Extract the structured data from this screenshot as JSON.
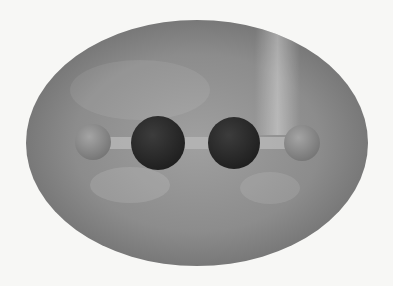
{
  "figure": {
    "title": "Acetylene molecule (H–C≡C–H) enclosed in electron density isosurface",
    "background": "#f7f7f5",
    "envelope": {
      "shape": "ellipsoid",
      "cx": 197,
      "cy": 143,
      "rx": 171,
      "ry": 123,
      "base_color": "#8c8c8c",
      "highlight_color": "#b8b8b8",
      "shadow_color": "#6a6a6a"
    },
    "bond": {
      "x1": 93,
      "x2": 302,
      "y": 143,
      "thickness": 12,
      "color": "#b4b4b4"
    },
    "atoms": [
      {
        "element": "H",
        "label": "hydrogen-left",
        "cx": 93,
        "cy": 142,
        "r": 18,
        "color": "#8e8e8e"
      },
      {
        "element": "C",
        "label": "carbon-left",
        "cx": 158,
        "cy": 143,
        "r": 27,
        "color": "#2e2e2e"
      },
      {
        "element": "C",
        "label": "carbon-right",
        "cx": 234,
        "cy": 143,
        "r": 26,
        "color": "#303030"
      },
      {
        "element": "H",
        "label": "hydrogen-right",
        "cx": 302,
        "cy": 143,
        "r": 18,
        "color": "#929292"
      }
    ]
  }
}
